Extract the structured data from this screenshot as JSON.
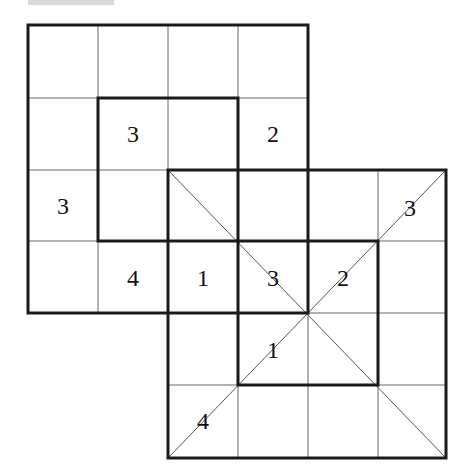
{
  "puzzle": {
    "type": "overlapping-grids-number-puzzle",
    "grid_a": {
      "cols": 4,
      "rows": 4,
      "origin_col": 0,
      "origin_row": 0
    },
    "grid_b": {
      "cols": 4,
      "rows": 4,
      "origin_col": 2,
      "origin_row": 2
    },
    "inner_box_a": {
      "col": 1,
      "row": 1,
      "cols": 2,
      "rows": 2
    },
    "inner_box_b": {
      "col": 3,
      "row": 3,
      "cols": 2,
      "rows": 2
    },
    "clues": [
      {
        "id": "c1",
        "value": "3",
        "x": 133,
        "y": 134
      },
      {
        "id": "c2",
        "value": "2",
        "x": 273,
        "y": 134
      },
      {
        "id": "c3",
        "value": "3",
        "x": 63,
        "y": 206
      },
      {
        "id": "c4",
        "value": "3",
        "x": 410,
        "y": 208
      },
      {
        "id": "c5",
        "value": "4",
        "x": 133,
        "y": 278
      },
      {
        "id": "c6",
        "value": "1",
        "x": 203,
        "y": 278
      },
      {
        "id": "c7",
        "value": "3",
        "x": 273,
        "y": 278
      },
      {
        "id": "c8",
        "value": "2",
        "x": 343,
        "y": 278
      },
      {
        "id": "c9",
        "value": "1",
        "x": 273,
        "y": 350
      },
      {
        "id": "c10",
        "value": "4",
        "x": 203,
        "y": 421
      }
    ]
  },
  "colors": {
    "line": "#222222",
    "thin_line": "#555555",
    "background": "#ffffff"
  }
}
